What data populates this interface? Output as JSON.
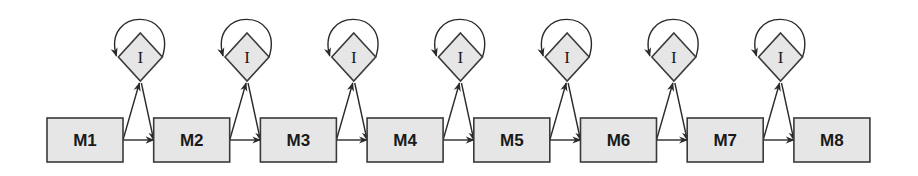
{
  "diagram": {
    "title": "",
    "colors": {
      "node_fill": "#e6e6e6",
      "node_stroke": "#3a3a3a",
      "edge": "#2a2a2a"
    },
    "machines": [
      {
        "id": "M1",
        "label": "M1"
      },
      {
        "id": "M2",
        "label": "M2"
      },
      {
        "id": "M3",
        "label": "M3"
      },
      {
        "id": "M4",
        "label": "M4"
      },
      {
        "id": "M5",
        "label": "M5"
      },
      {
        "id": "M6",
        "label": "M6"
      },
      {
        "id": "M7",
        "label": "M7"
      },
      {
        "id": "M8",
        "label": "M8"
      }
    ],
    "inspections": [
      {
        "id": "I1",
        "label": "I",
        "between": [
          "M1",
          "M2"
        ],
        "self_loop": true
      },
      {
        "id": "I2",
        "label": "I",
        "between": [
          "M2",
          "M3"
        ],
        "self_loop": true
      },
      {
        "id": "I3",
        "label": "I",
        "between": [
          "M3",
          "M4"
        ],
        "self_loop": true
      },
      {
        "id": "I4",
        "label": "I",
        "between": [
          "M4",
          "M5"
        ],
        "self_loop": true
      },
      {
        "id": "I5",
        "label": "I",
        "between": [
          "M5",
          "M6"
        ],
        "self_loop": true
      },
      {
        "id": "I6",
        "label": "I",
        "between": [
          "M6",
          "M7"
        ],
        "self_loop": true
      },
      {
        "id": "I7",
        "label": "I",
        "between": [
          "M7",
          "M8"
        ],
        "self_loop": true
      }
    ],
    "edges": [
      {
        "from": "M1",
        "to": "M2"
      },
      {
        "from": "M1",
        "to": "I1"
      },
      {
        "from": "I1",
        "to": "M2"
      },
      {
        "from": "I1",
        "to": "I1"
      },
      {
        "from": "M2",
        "to": "M3"
      },
      {
        "from": "M2",
        "to": "I2"
      },
      {
        "from": "I2",
        "to": "M3"
      },
      {
        "from": "I2",
        "to": "I2"
      },
      {
        "from": "M3",
        "to": "M4"
      },
      {
        "from": "M3",
        "to": "I3"
      },
      {
        "from": "I3",
        "to": "M4"
      },
      {
        "from": "I3",
        "to": "I3"
      },
      {
        "from": "M4",
        "to": "M5"
      },
      {
        "from": "M4",
        "to": "I4"
      },
      {
        "from": "I4",
        "to": "M5"
      },
      {
        "from": "I4",
        "to": "I4"
      },
      {
        "from": "M5",
        "to": "M6"
      },
      {
        "from": "M5",
        "to": "I5"
      },
      {
        "from": "I5",
        "to": "M6"
      },
      {
        "from": "I5",
        "to": "I5"
      },
      {
        "from": "M6",
        "to": "M7"
      },
      {
        "from": "M6",
        "to": "I6"
      },
      {
        "from": "I6",
        "to": "M7"
      },
      {
        "from": "I6",
        "to": "I6"
      },
      {
        "from": "M7",
        "to": "M8"
      },
      {
        "from": "M7",
        "to": "I7"
      },
      {
        "from": "I7",
        "to": "M8"
      },
      {
        "from": "I7",
        "to": "I7"
      }
    ]
  }
}
